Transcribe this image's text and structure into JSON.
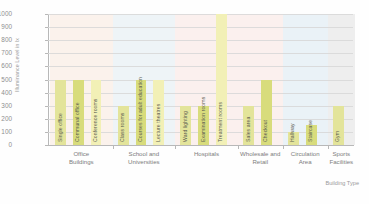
{
  "chart_data": {
    "type": "bar",
    "title": "",
    "xlabel": "Building Type",
    "ylabel": "Illuminance Level in lx",
    "ylim": [
      0,
      1000
    ],
    "ytick_labels": [
      "1000",
      "900",
      "800",
      "700",
      "600",
      "500",
      "400",
      "300",
      "200",
      "100",
      "0"
    ],
    "ytick_values": [
      1000,
      900,
      800,
      700,
      600,
      500,
      400,
      300,
      200,
      100,
      0
    ],
    "grid": true,
    "legend": "none",
    "groups": [
      {
        "label": "Office\nBuildings",
        "label_line1": "Office",
        "label_line2": "Buildings",
        "band_color": "#fbf2ec",
        "bars": [
          {
            "name": "Single office",
            "value": 500
          },
          {
            "name": "Communal office",
            "value": 500
          },
          {
            "name": "Conference rooms",
            "value": 500
          }
        ]
      },
      {
        "label_line1": "School and",
        "label_line2": "Universities",
        "band_color": "#eef4f7",
        "bars": [
          {
            "name": "Class rooms",
            "value": 300
          },
          {
            "name": "Courses for adult education",
            "value": 500
          },
          {
            "name": "Lecture theatres",
            "value": 500
          }
        ]
      },
      {
        "label_line1": "Hospitals",
        "label_line2": "",
        "band_color": "#fbf0ee",
        "bars": [
          {
            "name": "Ward lighting",
            "value": 300
          },
          {
            "name": "Examination rooms",
            "value": 300
          },
          {
            "name": "Treatment rooms",
            "value": 1000
          }
        ]
      },
      {
        "label_line1": "Wholesale and",
        "label_line2": "Retail",
        "band_color": "#fbf0ee",
        "bars": [
          {
            "name": "Sales area",
            "value": 300
          },
          {
            "name": "Checkout",
            "value": 500
          }
        ]
      },
      {
        "label_line1": "Circulation",
        "label_line2": "Area",
        "band_color": "#eaf2f7",
        "bars": [
          {
            "name": "Hallway",
            "value": 100
          },
          {
            "name": "Staircase",
            "value": 150
          }
        ]
      },
      {
        "label_line1": "Sports",
        "label_line2": "Facilities",
        "band_color": "#eeeeee",
        "bars": [
          {
            "name": "Gym",
            "value": 300
          }
        ]
      }
    ]
  },
  "colors": {
    "bar": "#e3e49a",
    "bar_alt": "#d8dc7c",
    "bar_pale": "#f2f0b6",
    "grid": "#d7d7d7",
    "axis": "#b8b8b8",
    "text": "#8e8e8e"
  }
}
